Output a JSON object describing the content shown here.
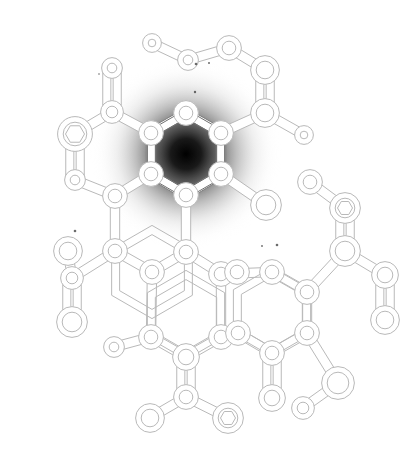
{
  "figure": {
    "kind": "molecule-attention-map",
    "title": "",
    "width": 417,
    "height": 453,
    "background_color": "#ffffff",
    "bond_stroke_color": "#b9b9b9",
    "bond_fill_color": "#ffffff",
    "atom_stroke_color": "#b9b9b9",
    "atom_fill_color": "#ffffff",
    "highlight_color": "#000000",
    "highlight_mid_color": "#6e6e6e",
    "highlight_outer_color": "#d8d8d8"
  },
  "heatmap": {
    "label": "attention-highlight",
    "type": "radial-gradient",
    "center_x": 186,
    "center_y": 154,
    "radius": 96,
    "peak_opacity": 1.0,
    "stops": [
      {
        "offset": 0.0,
        "color": "#000000",
        "opacity": 1.0
      },
      {
        "offset": 0.16,
        "color": "#0d0d0d",
        "opacity": 0.95
      },
      {
        "offset": 0.34,
        "color": "#3d3d3d",
        "opacity": 0.76
      },
      {
        "offset": 0.52,
        "color": "#7a7a7a",
        "opacity": 0.5
      },
      {
        "offset": 0.72,
        "color": "#bcbcbc",
        "opacity": 0.24
      },
      {
        "offset": 0.88,
        "color": "#e6e6e6",
        "opacity": 0.08
      },
      {
        "offset": 1.0,
        "color": "#ffffff",
        "opacity": 0.0
      }
    ]
  },
  "rings": [
    {
      "name": "ring-top-highlighted",
      "cx": 186,
      "cy": 154,
      "r": 40,
      "rotation": 0,
      "highlighted": true
    },
    {
      "name": "ring-middle-left",
      "cx": 152,
      "cy": 272,
      "r": 42,
      "rotation": 0,
      "highlighted": false
    },
    {
      "name": "ring-lower-left",
      "cx": 186,
      "cy": 315,
      "r": 40,
      "rotation": 0,
      "highlighted": false
    },
    {
      "name": "ring-lower-right",
      "cx": 272,
      "cy": 312,
      "r": 40,
      "rotation": 0,
      "highlighted": false
    }
  ],
  "atoms": [
    {
      "id": 0,
      "x": 186,
      "y": 113,
      "r": 9,
      "marker": "ring"
    },
    {
      "id": 1,
      "x": 221,
      "y": 133,
      "r": 9,
      "marker": "ring"
    },
    {
      "id": 2,
      "x": 221,
      "y": 174,
      "r": 9,
      "marker": "ring"
    },
    {
      "id": 3,
      "x": 186,
      "y": 195,
      "r": 9,
      "marker": "ring"
    },
    {
      "id": 4,
      "x": 151,
      "y": 174,
      "r": 9,
      "marker": "ring"
    },
    {
      "id": 5,
      "x": 151,
      "y": 133,
      "r": 9,
      "marker": "ring"
    },
    {
      "id": 6,
      "x": 115,
      "y": 196,
      "r": 9,
      "marker": "ring"
    },
    {
      "id": 7,
      "x": 115,
      "y": 251,
      "r": 9,
      "marker": "ring"
    },
    {
      "id": 8,
      "x": 152,
      "y": 272,
      "r": 9,
      "marker": "ring"
    },
    {
      "id": 9,
      "x": 186,
      "y": 252,
      "r": 9,
      "marker": "ring"
    },
    {
      "id": 10,
      "x": 151,
      "y": 337,
      "r": 9,
      "marker": "ring"
    },
    {
      "id": 11,
      "x": 186,
      "y": 357,
      "r": 10,
      "marker": "ring"
    },
    {
      "id": 12,
      "x": 221,
      "y": 337,
      "r": 9,
      "marker": "ring"
    },
    {
      "id": 13,
      "x": 221,
      "y": 274,
      "r": 9,
      "marker": "ring"
    },
    {
      "id": 14,
      "x": 237,
      "y": 272,
      "r": 9,
      "marker": "ring"
    },
    {
      "id": 15,
      "x": 272,
      "y": 272,
      "r": 9,
      "marker": "ring"
    },
    {
      "id": 16,
      "x": 307,
      "y": 292,
      "r": 9,
      "marker": "ring"
    },
    {
      "id": 17,
      "x": 307,
      "y": 333,
      "r": 9,
      "marker": "ring"
    },
    {
      "id": 18,
      "x": 272,
      "y": 353,
      "r": 9,
      "marker": "ring"
    },
    {
      "id": 19,
      "x": 238,
      "y": 333,
      "r": 9,
      "marker": "ring"
    },
    {
      "id": 20,
      "x": 265,
      "y": 113,
      "r": 11,
      "marker": "ring"
    },
    {
      "id": 21,
      "x": 265,
      "y": 70,
      "r": 11,
      "marker": "ring"
    },
    {
      "id": 22,
      "x": 229,
      "y": 48,
      "r": 9,
      "marker": "ring"
    },
    {
      "id": 23,
      "x": 188,
      "y": 60,
      "r": 7,
      "marker": "ring"
    },
    {
      "id": 24,
      "x": 152,
      "y": 43,
      "r": 6,
      "marker": "ring"
    },
    {
      "id": 25,
      "x": 304,
      "y": 135,
      "r": 6,
      "marker": "ring"
    },
    {
      "id": 26,
      "x": 266,
      "y": 205,
      "r": 12,
      "marker": "ring"
    },
    {
      "id": 27,
      "x": 112,
      "y": 68,
      "r": 7,
      "marker": "ring"
    },
    {
      "id": 28,
      "x": 112,
      "y": 112,
      "r": 8,
      "marker": "ring"
    },
    {
      "id": 29,
      "x": 75,
      "y": 134,
      "r": 14,
      "marker": "hexagon"
    },
    {
      "id": 30,
      "x": 75,
      "y": 180,
      "r": 7,
      "marker": "ring"
    },
    {
      "id": 31,
      "x": 68,
      "y": 251,
      "r": 11,
      "marker": "ring"
    },
    {
      "id": 32,
      "x": 72,
      "y": 278,
      "r": 8,
      "marker": "ring"
    },
    {
      "id": 33,
      "x": 72,
      "y": 322,
      "r": 12,
      "marker": "ring"
    },
    {
      "id": 34,
      "x": 114,
      "y": 347,
      "r": 7,
      "marker": "ring"
    },
    {
      "id": 35,
      "x": 186,
      "y": 397,
      "r": 9,
      "marker": "ring"
    },
    {
      "id": 36,
      "x": 150,
      "y": 418,
      "r": 11,
      "marker": "ring"
    },
    {
      "id": 37,
      "x": 228,
      "y": 418,
      "r": 12,
      "marker": "hexagon"
    },
    {
      "id": 38,
      "x": 272,
      "y": 398,
      "r": 10,
      "marker": "ring"
    },
    {
      "id": 39,
      "x": 345,
      "y": 208,
      "r": 12,
      "marker": "hexagon"
    },
    {
      "id": 40,
      "x": 310,
      "y": 182,
      "r": 9,
      "marker": "ring"
    },
    {
      "id": 41,
      "x": 345,
      "y": 251,
      "r": 12,
      "marker": "ring"
    },
    {
      "id": 42,
      "x": 385,
      "y": 275,
      "r": 10,
      "marker": "ring"
    },
    {
      "id": 43,
      "x": 385,
      "y": 320,
      "r": 11,
      "marker": "ring"
    },
    {
      "id": 44,
      "x": 338,
      "y": 383,
      "r": 13,
      "marker": "ring"
    },
    {
      "id": 45,
      "x": 303,
      "y": 408,
      "r": 8,
      "marker": "ring"
    }
  ],
  "bonds": [
    {
      "a": 0,
      "b": 1,
      "order": 1,
      "highlighted": true
    },
    {
      "a": 1,
      "b": 2,
      "order": 1,
      "highlighted": true
    },
    {
      "a": 2,
      "b": 3,
      "order": 1,
      "highlighted": true
    },
    {
      "a": 3,
      "b": 4,
      "order": 1,
      "highlighted": true
    },
    {
      "a": 4,
      "b": 5,
      "order": 1,
      "highlighted": true
    },
    {
      "a": 5,
      "b": 0,
      "order": 1,
      "highlighted": true
    },
    {
      "a": 4,
      "b": 6,
      "order": 1,
      "highlighted": false
    },
    {
      "a": 6,
      "b": 7,
      "order": 1,
      "highlighted": false
    },
    {
      "a": 7,
      "b": 8,
      "order": 1,
      "highlighted": false
    },
    {
      "a": 8,
      "b": 9,
      "order": 1,
      "highlighted": false
    },
    {
      "a": 9,
      "b": 3,
      "order": 1,
      "highlighted": false
    },
    {
      "a": 8,
      "b": 10,
      "order": 1,
      "highlighted": false
    },
    {
      "a": 10,
      "b": 11,
      "order": 1,
      "highlighted": false
    },
    {
      "a": 11,
      "b": 12,
      "order": 1,
      "highlighted": false
    },
    {
      "a": 12,
      "b": 13,
      "order": 1,
      "highlighted": false
    },
    {
      "a": 13,
      "b": 9,
      "order": 1,
      "highlighted": false
    },
    {
      "a": 13,
      "b": 15,
      "order": 1,
      "highlighted": false
    },
    {
      "a": 15,
      "b": 16,
      "order": 1,
      "highlighted": false
    },
    {
      "a": 16,
      "b": 17,
      "order": 1,
      "highlighted": false
    },
    {
      "a": 17,
      "b": 18,
      "order": 1,
      "highlighted": false
    },
    {
      "a": 18,
      "b": 19,
      "order": 1,
      "highlighted": false
    },
    {
      "a": 19,
      "b": 12,
      "order": 1,
      "highlighted": false
    },
    {
      "a": 1,
      "b": 20,
      "order": 1,
      "highlighted": false
    },
    {
      "a": 20,
      "b": 21,
      "order": 2,
      "highlighted": false
    },
    {
      "a": 21,
      "b": 22,
      "order": 1,
      "highlighted": false
    },
    {
      "a": 22,
      "b": 23,
      "order": 1,
      "highlighted": false
    },
    {
      "a": 23,
      "b": 24,
      "order": 1,
      "highlighted": false
    },
    {
      "a": 20,
      "b": 25,
      "order": 1,
      "highlighted": false
    },
    {
      "a": 2,
      "b": 26,
      "order": 1,
      "highlighted": false
    },
    {
      "a": 5,
      "b": 28,
      "order": 1,
      "highlighted": false
    },
    {
      "a": 28,
      "b": 27,
      "order": 2,
      "highlighted": false
    },
    {
      "a": 28,
      "b": 29,
      "order": 1,
      "highlighted": false
    },
    {
      "a": 29,
      "b": 30,
      "order": 2,
      "highlighted": false
    },
    {
      "a": 30,
      "b": 6,
      "order": 1,
      "highlighted": false
    },
    {
      "a": 7,
      "b": 32,
      "order": 1,
      "highlighted": false
    },
    {
      "a": 32,
      "b": 31,
      "order": 1,
      "highlighted": false
    },
    {
      "a": 32,
      "b": 33,
      "order": 2,
      "highlighted": false
    },
    {
      "a": 10,
      "b": 34,
      "order": 1,
      "highlighted": false
    },
    {
      "a": 11,
      "b": 35,
      "order": 2,
      "highlighted": false
    },
    {
      "a": 35,
      "b": 36,
      "order": 1,
      "highlighted": false
    },
    {
      "a": 35,
      "b": 37,
      "order": 1,
      "highlighted": false
    },
    {
      "a": 18,
      "b": 38,
      "order": 2,
      "highlighted": false
    },
    {
      "a": 16,
      "b": 41,
      "order": 1,
      "highlighted": false
    },
    {
      "a": 41,
      "b": 39,
      "order": 2,
      "highlighted": false
    },
    {
      "a": 39,
      "b": 40,
      "order": 1,
      "highlighted": false
    },
    {
      "a": 41,
      "b": 42,
      "order": 1,
      "highlighted": false
    },
    {
      "a": 42,
      "b": 43,
      "order": 2,
      "highlighted": false
    },
    {
      "a": 17,
      "b": 44,
      "order": 1,
      "highlighted": false
    },
    {
      "a": 44,
      "b": 45,
      "order": 1,
      "highlighted": false
    }
  ],
  "speckles": [
    {
      "x": 196,
      "y": 64,
      "r": 1.3
    },
    {
      "x": 209,
      "y": 63,
      "r": 1.0
    },
    {
      "x": 195,
      "y": 92,
      "r": 1.2
    },
    {
      "x": 75,
      "y": 231,
      "r": 1.3
    },
    {
      "x": 277,
      "y": 245,
      "r": 1.3
    },
    {
      "x": 262,
      "y": 246,
      "r": 0.9
    },
    {
      "x": 99,
      "y": 74,
      "r": 0.8
    }
  ]
}
